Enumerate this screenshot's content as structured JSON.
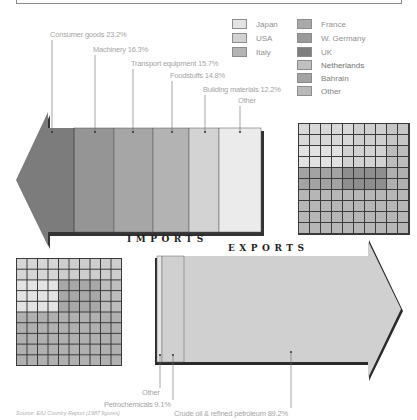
{
  "legend": {
    "items": [
      {
        "label": "Japan",
        "color": "#e3e3e3"
      },
      {
        "label": "USA",
        "color": "#d2d2d2"
      },
      {
        "label": "Italy",
        "color": "#b4b4b4"
      },
      {
        "label": "France",
        "color": "#a9a9a9"
      },
      {
        "label": "W. Germany",
        "color": "#9a9a9a"
      },
      {
        "label": "UK",
        "color": "#7e7e7e"
      },
      {
        "label": "Netherlands",
        "color": "#c0c0c0"
      },
      {
        "label": "Bahrain",
        "color": "#a3a3a3"
      },
      {
        "label": "Other",
        "color": "#b9b9b9"
      }
    ]
  },
  "imports": {
    "title": "IMPORTS",
    "segments": [
      {
        "label": "Consumer goods 23.2%",
        "color": "#7c7c7c"
      },
      {
        "label": "Machinery 16.3%",
        "color": "#959595"
      },
      {
        "label": "Transport equipment 15.7%",
        "color": "#a6a6a6"
      },
      {
        "label": "Foodstuffs 14.8%",
        "color": "#b3b3b3"
      },
      {
        "label": "Building materials 12.2%",
        "color": "#d3d3d3"
      },
      {
        "label": "Other",
        "color": "#ebebeb"
      }
    ]
  },
  "exports": {
    "title": "EXPORTS",
    "segments": [
      {
        "label": "Other",
        "color": "#e6e6e6"
      },
      {
        "label": "Petrochemicals 9.1%",
        "color": "#d0d0d0"
      },
      {
        "label": "Crude oil & refined petroleum 89.2%",
        "color": "#d0d0d0"
      }
    ]
  },
  "source": "Source: EIU Country Report (1987 figures)",
  "chart_data": [
    {
      "type": "bar",
      "title": "IMPORTS",
      "categories": [
        "Consumer goods",
        "Machinery",
        "Transport equipment",
        "Foodstuffs",
        "Building materials",
        "Other"
      ],
      "values": [
        23.2,
        16.3,
        15.7,
        14.8,
        12.2,
        17.8
      ],
      "unit": "%",
      "note": "Other value not labeled; derived remainder"
    },
    {
      "type": "bar",
      "title": "EXPORTS",
      "categories": [
        "Other",
        "Petrochemicals",
        "Crude oil & refined petroleum"
      ],
      "values": [
        1.7,
        9.1,
        89.2
      ],
      "unit": "%",
      "note": "Other value not labeled; derived remainder"
    },
    {
      "type": "heatmap",
      "title": "Imports by origin (10x10 unit grid)",
      "legend": [
        "Japan",
        "USA",
        "Italy",
        "France",
        "W. Germany",
        "UK",
        "Netherlands",
        "Bahrain",
        "Other"
      ]
    },
    {
      "type": "heatmap",
      "title": "Exports by destination (10x10 unit grid)",
      "legend": [
        "Japan",
        "USA",
        "Italy",
        "France",
        "W. Germany",
        "UK",
        "Netherlands",
        "Bahrain",
        "Other"
      ]
    }
  ]
}
